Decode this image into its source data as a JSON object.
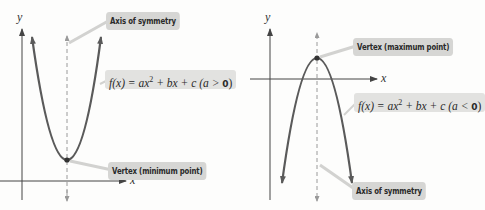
{
  "left_graph": {
    "y_axis_label": "y",
    "x_axis_label": "x",
    "callout_axis": "Axis of symmetry",
    "callout_vertex": "Vertex (minimum point)",
    "formula": {
      "prefix": "f(x) = ax",
      "exponent": "2",
      "middle": " + bx + c (a > ",
      "zero": "0",
      "suffix": ")"
    },
    "opens": "up"
  },
  "right_graph": {
    "y_axis_label": "y",
    "x_axis_label": "x",
    "callout_axis": "Axis of symmetry",
    "callout_vertex": "Vertex (maximum point)",
    "formula": {
      "prefix": "f(x) = ax",
      "exponent": "2",
      "middle": " + bx + c (a < ",
      "zero": "0",
      "suffix": ")"
    },
    "opens": "down"
  },
  "colors": {
    "curve": "#5a5a5a",
    "axis": "#444444",
    "symmetry_line": "#9a9a9a",
    "callout_bg": "#d6d6d4",
    "leader": "#cfcfcd"
  }
}
